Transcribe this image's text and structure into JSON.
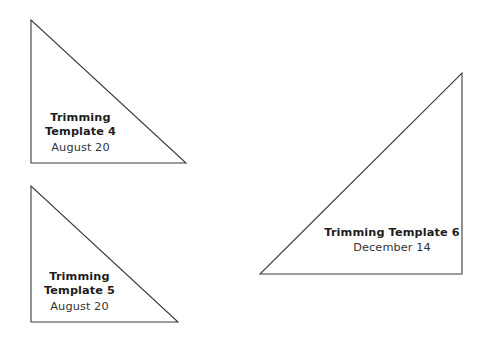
{
  "page": {
    "background_color": "#ffffff",
    "width": 485,
    "height": 339,
    "stroke_color": "#3b3b3b",
    "text_color": "#1d1d1d",
    "date_text_color": "#333333"
  },
  "shapes": [
    {
      "id": "template-4",
      "kind": "right-triangle",
      "right_angle_corner": "bottom-left",
      "points": "31,20 31,163 186,163",
      "title_line_1": "Trimming",
      "title_line_2": "Template 4",
      "date": "August 20"
    },
    {
      "id": "template-5",
      "kind": "right-triangle",
      "right_angle_corner": "bottom-left",
      "points": "31,186 31,322 178,322",
      "title_line_1": "Trimming",
      "title_line_2": "Template 5",
      "date": "August 20"
    },
    {
      "id": "template-6",
      "kind": "right-triangle",
      "right_angle_corner": "bottom-right",
      "points": "462,73 462,274 260,274",
      "title_line_1": "Trimming Template 6",
      "title_line_2": "",
      "date": "December 14"
    }
  ]
}
